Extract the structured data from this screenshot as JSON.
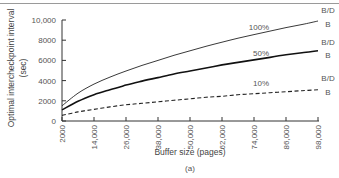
{
  "chart_data": {
    "type": "line",
    "title": "",
    "caption": "(a)",
    "xlabel": "Buffer size (pages)",
    "ylabel": "Optimal intercheckpoint interval",
    "ylabel_unit": "(sec)",
    "xlim": [
      2000,
      98000
    ],
    "ylim": [
      0,
      10000
    ],
    "x_ticks": [
      2000,
      14000,
      26000,
      38000,
      50000,
      62000,
      74000,
      86000,
      98000
    ],
    "x_tick_labels": [
      "2000",
      "14,000",
      "26,000",
      "38,000",
      "50,000",
      "62,000",
      "74,000",
      "86,000",
      "98,000"
    ],
    "y_ticks": [
      0,
      2000,
      4000,
      6000,
      8000,
      10000
    ],
    "y_tick_labels": [
      "0",
      "2000",
      "4000",
      "6000",
      "8000",
      "10,000"
    ],
    "grid": false,
    "x": [
      2000,
      8000,
      14000,
      20000,
      26000,
      32000,
      38000,
      44000,
      50000,
      56000,
      62000,
      68000,
      74000,
      80000,
      86000,
      92000,
      98000
    ],
    "series": [
      {
        "name": "100%",
        "style": "solid-thin",
        "values": [
          1500,
          2750,
          3650,
          4350,
          4950,
          5500,
          6000,
          6500,
          6950,
          7400,
          7800,
          8200,
          8550,
          8900,
          9250,
          9550,
          9900
        ]
      },
      {
        "name": "50%",
        "style": "solid-thick",
        "values": [
          1100,
          1950,
          2600,
          3100,
          3550,
          3950,
          4300,
          4650,
          4950,
          5250,
          5550,
          5800,
          6050,
          6300,
          6550,
          6750,
          6950
        ]
      },
      {
        "name": "10%",
        "style": "dashed",
        "values": [
          550,
          900,
          1150,
          1400,
          1600,
          1750,
          1900,
          2050,
          2200,
          2350,
          2450,
          2600,
          2700,
          2800,
          2900,
          3000,
          3100
        ]
      }
    ],
    "annotations": {
      "series_labels": [
        "100%",
        "50%",
        "10%"
      ],
      "end_labels_upper": "B/D",
      "end_labels_lower": "B"
    }
  }
}
